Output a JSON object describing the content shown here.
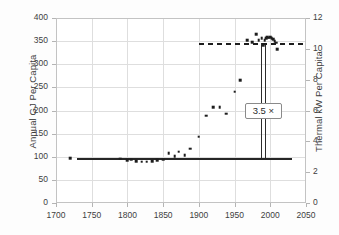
{
  "chart_data": {
    "type": "scatter",
    "title": "",
    "xlabel": "",
    "ylabel": "Annual GJ Per Capita",
    "y2label": "Thermal kW Per Capita",
    "xlim": [
      1700,
      2050
    ],
    "ylim": [
      0,
      400
    ],
    "y2lim": [
      0,
      12
    ],
    "grid": true,
    "legend": "none",
    "xticks": [
      "1700",
      "1750",
      "1800",
      "1850",
      "1900",
      "1950",
      "2000",
      "2050"
    ],
    "yticks": [
      "0",
      "50",
      "100",
      "150",
      "200",
      "250",
      "300",
      "350",
      "400"
    ],
    "y2ticks": [
      "0",
      "2",
      "4",
      "6",
      "8",
      "10",
      "12"
    ],
    "series": [
      {
        "name": "Annual GJ Per Capita",
        "x": [
          1720,
          1790,
          1800,
          1805,
          1812,
          1820,
          1827,
          1835,
          1842,
          1850,
          1858,
          1866,
          1872,
          1880,
          1888,
          1900,
          1910,
          1920,
          1929,
          1938,
          1950,
          1958,
          1968,
          1975,
          1980,
          1984,
          1988,
          1990,
          1992,
          1994,
          1996,
          1998,
          2000,
          2002,
          2004,
          2006,
          2008,
          2010
        ],
        "y": [
          97,
          96,
          92,
          94,
          90,
          89,
          89,
          91,
          92,
          94,
          108,
          101,
          111,
          103,
          117,
          143,
          189,
          207,
          207,
          193,
          241,
          265,
          352,
          348,
          365,
          352,
          356,
          341,
          352,
          356,
          359,
          357,
          358,
          356,
          354,
          350,
          347,
          332
        ]
      }
    ],
    "reference_lines": [
      {
        "name": "pre-industrial-baseline",
        "orientation": "horizontal",
        "value": 98,
        "style": "solid",
        "x_start": 1730,
        "x_end": 2030
      },
      {
        "name": "modern-plateau",
        "orientation": "vertical-pair",
        "value": 1990,
        "style": "solid"
      },
      {
        "name": "modern-level",
        "orientation": "horizontal",
        "value": 345,
        "style": "dashed",
        "x_start": 1900,
        "x_end": 2050
      }
    ],
    "annotations": [
      {
        "name": "ratio-callout",
        "text": "3.5 ×",
        "x": 1990,
        "y": 200
      }
    ]
  }
}
